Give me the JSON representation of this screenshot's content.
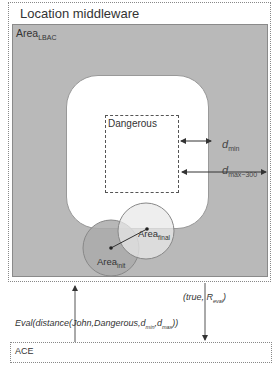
{
  "middleware": {
    "title": "Location middleware",
    "area_lbac": {
      "base": "Area",
      "sub": "LBAC"
    }
  },
  "zones": {
    "dangerous_label": "Dangerous",
    "dmin": {
      "base": "d",
      "sub": "min"
    },
    "dmax": {
      "base": "d",
      "sub": "max−300"
    }
  },
  "areas": {
    "init": {
      "base": "Area",
      "sub": "init"
    },
    "final": {
      "base": "Area",
      "sub": "final"
    }
  },
  "messages": {
    "request": {
      "prefix": "Eval(distance(John,Dangerous,d",
      "sub1": "min",
      "mid": ",d",
      "sub2": "max",
      "suffix": "))"
    },
    "response": {
      "prefix": "(true, R",
      "sub": "eval",
      "suffix": ")"
    }
  },
  "ace": {
    "label": "ACE"
  },
  "colors": {
    "gray_area": "#b9b9b9",
    "circle_init": "#aaaaaa",
    "circle_final": "#e6e6e6",
    "line": "#444444"
  }
}
